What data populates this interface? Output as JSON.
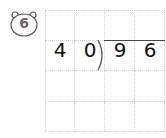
{
  "problem": {
    "number": "6",
    "divisor": [
      "4",
      "0"
    ],
    "dividend": [
      "9",
      "6"
    ]
  },
  "grid": {
    "rows": 4,
    "cols": 4
  }
}
